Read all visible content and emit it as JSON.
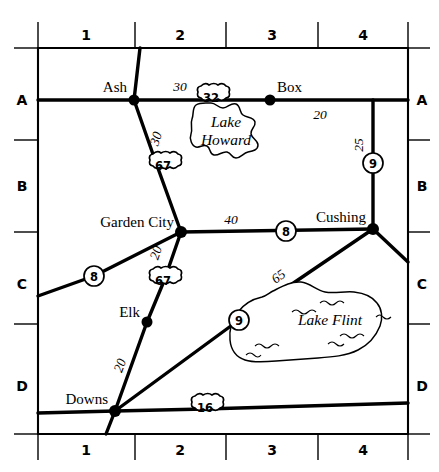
{
  "map": {
    "title": "Road map with grid index",
    "grid": {
      "column_labels": [
        "1",
        "2",
        "3",
        "4"
      ],
      "row_labels": [
        "A",
        "B",
        "C",
        "D"
      ]
    },
    "cities": [
      {
        "name": "Ash",
        "grid": "A1"
      },
      {
        "name": "Box",
        "grid": "A3"
      },
      {
        "name": "Garden City",
        "grid": "B2"
      },
      {
        "name": "Cushing",
        "grid": "B4"
      },
      {
        "name": "Elk",
        "grid": "C1"
      },
      {
        "name": "Downs",
        "grid": "D1"
      }
    ],
    "lakes": [
      {
        "name": "Lake Howard",
        "grid": "A2"
      },
      {
        "name": "Lake Flint",
        "grid": "C3"
      }
    ],
    "route_markers": [
      {
        "number": "32",
        "type": "us-shield",
        "grid": "A2"
      },
      {
        "number": "67",
        "type": "us-shield",
        "grid": "B2"
      },
      {
        "number": "67",
        "type": "us-shield",
        "grid": "C2"
      },
      {
        "number": "16",
        "type": "us-shield",
        "grid": "D2"
      },
      {
        "number": "9",
        "type": "state-circle",
        "grid": "B4"
      },
      {
        "number": "8",
        "type": "state-circle",
        "grid": "B3"
      },
      {
        "number": "8",
        "type": "state-circle",
        "grid": "C1"
      },
      {
        "number": "9",
        "type": "state-circle",
        "grid": "C2"
      }
    ],
    "distances": [
      {
        "value": "30",
        "between": "Ash - Lake Howard junction"
      },
      {
        "value": "20",
        "between": "Box - east junction"
      },
      {
        "value": "25",
        "between": "east junction - Route 9"
      },
      {
        "value": "30",
        "between": "Ash - Route 67"
      },
      {
        "value": "40",
        "between": "Garden City - Cushing"
      },
      {
        "value": "20",
        "between": "Garden City - Route 67"
      },
      {
        "value": "65",
        "between": "Route 9 - Cushing"
      },
      {
        "value": "20",
        "between": "Downs - Elk"
      }
    ]
  }
}
